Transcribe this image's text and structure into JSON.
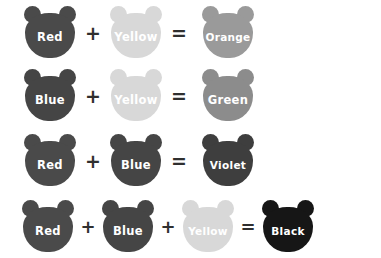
{
  "page": {
    "background_color": "#ffffff",
    "label_text_color": "#ffffff",
    "operator_color": "#2f2f2f"
  },
  "colors": {
    "red": "#4a4a4a",
    "blue": "#454545",
    "yellow": "#d8d8d8",
    "orange": "#9a9a9a",
    "green": "#8c8c8c",
    "violet": "#3e3e3e",
    "black": "#161616"
  },
  "operators": {
    "plus": "+",
    "equals": "="
  },
  "equations": [
    {
      "id": "equation-1",
      "terms": [
        "Red",
        "Yellow"
      ],
      "result": "Orange",
      "term_colors": [
        "#4a4a4a",
        "#d8d8d8"
      ],
      "result_color": "#9a9a9a"
    },
    {
      "id": "equation-2",
      "terms": [
        "Blue",
        "Yellow"
      ],
      "result": "Green",
      "term_colors": [
        "#454545",
        "#d8d8d8"
      ],
      "result_color": "#8c8c8c"
    },
    {
      "id": "equation-3",
      "terms": [
        "Red",
        "Blue"
      ],
      "result": "Violet",
      "term_colors": [
        "#4a4a4a",
        "#454545"
      ],
      "result_color": "#3e3e3e"
    },
    {
      "id": "equation-4",
      "terms": [
        "Red",
        "Blue",
        "Yellow"
      ],
      "result": "Black",
      "term_colors": [
        "#4a4a4a",
        "#454545",
        "#d8d8d8"
      ],
      "result_color": "#161616"
    }
  ]
}
